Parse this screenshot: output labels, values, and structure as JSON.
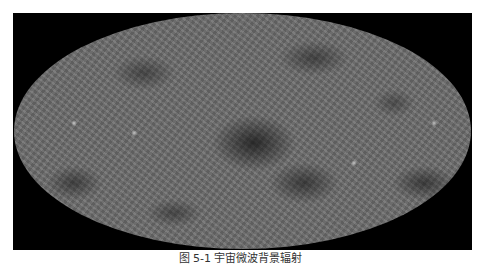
{
  "figure": {
    "background_color": "#000000",
    "map_base_color": "#6e6e6e"
  },
  "caption": {
    "text": "图 5-1 宇宙微波背景辐射"
  }
}
